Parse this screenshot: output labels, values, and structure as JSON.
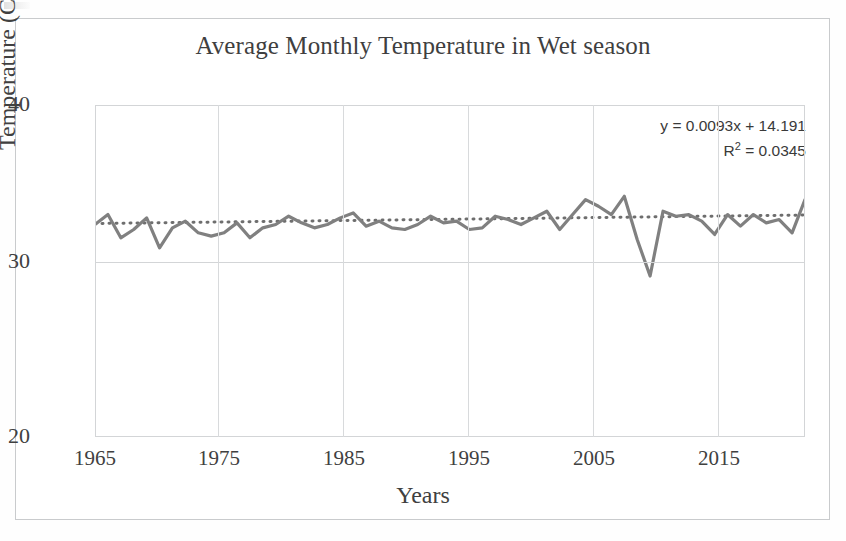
{
  "chart_data": {
    "type": "line",
    "title": "Average Monthly Temperature in Wet season",
    "xlabel": "Years",
    "ylabel": "Temperature (CO)",
    "ylim": [
      20,
      40
    ],
    "xlim": [
      1965,
      2020
    ],
    "yticks": [
      "40",
      "30",
      "20"
    ],
    "xticks": [
      "1965",
      "1975",
      "1985",
      "1995",
      "2005",
      "2015"
    ],
    "grid": true,
    "legend": "none",
    "annotations": {
      "equation": "y = 0.0093x + 14.191",
      "r_squared_prefix": "R",
      "r_squared_sup": "2",
      "r_squared_value": " = 0.0345"
    },
    "series": [
      {
        "name": "Average Monthly Temperature",
        "style": "solid",
        "color": "#7f7f7f",
        "x": [
          1965,
          1966,
          1967,
          1968,
          1969,
          1970,
          1971,
          1972,
          1973,
          1974,
          1975,
          1976,
          1977,
          1978,
          1979,
          1980,
          1981,
          1982,
          1983,
          1984,
          1985,
          1986,
          1987,
          1988,
          1989,
          1990,
          1991,
          1992,
          1993,
          1994,
          1995,
          1996,
          1997,
          1998,
          1999,
          2000,
          2001,
          2002,
          2003,
          2004,
          2005,
          2006,
          2007,
          2008,
          2009,
          2010,
          2011,
          2012,
          2013,
          2014,
          2015,
          2016,
          2017,
          2018,
          2019,
          2020
        ],
        "values": [
          32.8,
          33.4,
          32.0,
          32.5,
          33.2,
          31.4,
          32.6,
          33.0,
          32.3,
          32.1,
          32.3,
          32.9,
          32.0,
          32.6,
          32.8,
          33.3,
          32.9,
          32.6,
          32.8,
          33.2,
          33.5,
          32.7,
          33.0,
          32.6,
          32.5,
          32.8,
          33.3,
          32.9,
          33.0,
          32.5,
          32.6,
          33.3,
          33.1,
          32.8,
          33.2,
          33.6,
          32.5,
          33.4,
          34.3,
          33.9,
          33.4,
          34.5,
          31.9,
          29.7,
          33.6,
          33.3,
          33.4,
          33.0,
          32.2,
          33.4,
          32.7,
          33.4,
          32.9,
          33.1,
          32.3,
          34.3
        ]
      },
      {
        "name": "Linear trendline",
        "style": "dotted",
        "color": "#6e6e6e",
        "x": [
          1965,
          2020
        ],
        "values": [
          32.86,
          33.37
        ]
      }
    ]
  },
  "figure": {
    "title": "Average Monthly Temperature in Wet season",
    "x_axis_title": "Years",
    "y_axis_title": "Temperature (CO)"
  }
}
